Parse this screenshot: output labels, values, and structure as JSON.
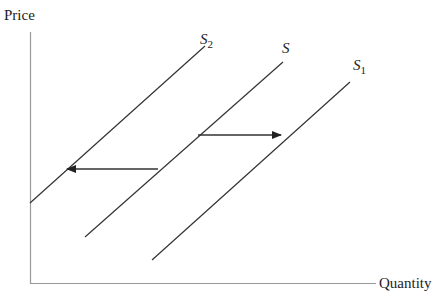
{
  "diagram": {
    "type": "supply-shift",
    "y_axis_label": "Price",
    "x_axis_label": "Quantity",
    "curves": [
      {
        "id": "S2",
        "label_main": "S",
        "label_sub": "2",
        "x1": 30,
        "y1": 203,
        "x2": 205,
        "y2": 46
      },
      {
        "id": "S",
        "label_main": "S",
        "label_sub": "",
        "x1": 85,
        "y1": 237,
        "x2": 283,
        "y2": 62
      },
      {
        "id": "S1",
        "label_main": "S",
        "label_sub": "1",
        "x1": 152,
        "y1": 260,
        "x2": 350,
        "y2": 82
      }
    ],
    "arrows": [
      {
        "id": "shift-left",
        "from": "S",
        "to": "S2",
        "direction": "left"
      },
      {
        "id": "shift-right",
        "from": "S",
        "to": "S1",
        "direction": "right"
      }
    ],
    "colors": {
      "line": "#333333",
      "axis": "#999999",
      "text": "#222222"
    }
  }
}
